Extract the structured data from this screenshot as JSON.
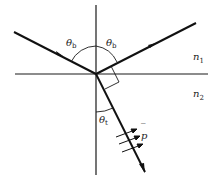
{
  "diagram": {
    "labels": {
      "incident_angle": "θ",
      "incident_angle_sub": "b",
      "reflected_angle": "θ",
      "reflected_angle_sub": "b",
      "transmitted_angle": "θ",
      "transmitted_angle_sub": "t",
      "medium1": "n",
      "medium1_sub": "1",
      "medium2": "n",
      "medium2_sub": "2",
      "polarization": "p",
      "polarization_bar": "‾"
    },
    "colors": {
      "line": "#1a1a1a",
      "ray": "#111111",
      "background": "#ffffff"
    }
  }
}
